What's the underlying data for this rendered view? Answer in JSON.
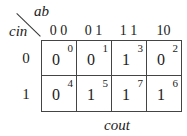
{
  "kmap": {
    "col_var": "ab",
    "row_var": "cin",
    "output_label": "cout",
    "col_headers": [
      "0 0",
      "0 1",
      "1 1",
      "10"
    ],
    "row_headers": [
      "0",
      "1"
    ],
    "cells": [
      [
        {
          "value": "0",
          "index": "0"
        },
        {
          "value": "0",
          "index": "1"
        },
        {
          "value": "1",
          "index": "3"
        },
        {
          "value": "0",
          "index": "2"
        }
      ],
      [
        {
          "value": "0",
          "index": "4"
        },
        {
          "value": "1",
          "index": "5"
        },
        {
          "value": "1",
          "index": "7"
        },
        {
          "value": "1",
          "index": "6"
        }
      ]
    ]
  }
}
